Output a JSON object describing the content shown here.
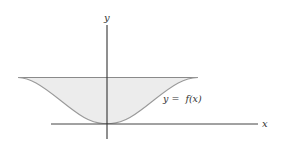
{
  "figure": {
    "y_axis_label": "y",
    "x_axis_label": "x",
    "curve_label": "y =  f(x)",
    "colors": {
      "axis": "#333333",
      "curve": "#9a9a9a",
      "fill": "#ececec",
      "top_line": "#8a8a8a"
    }
  }
}
